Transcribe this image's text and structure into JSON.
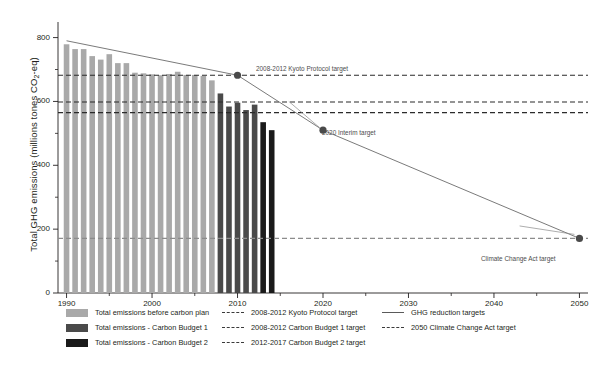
{
  "chart_data": {
    "type": "bar",
    "title": "",
    "xlabel": "",
    "ylabel": "Total GHG emissions (millions tones CO2-eq)",
    "ylabel_parts": {
      "pre": "Total GHG emissions (millions tones CO",
      "sub": "2",
      "post": "-eq)"
    },
    "xlim": [
      1989,
      2051
    ],
    "ylim": [
      0,
      830
    ],
    "yticks": [
      0,
      200,
      400,
      600,
      800
    ],
    "yticklabels": [
      "0",
      "200",
      "400",
      "600",
      "800"
    ],
    "yticks_minor": [
      100,
      300,
      500,
      700
    ],
    "xticks": [
      1990,
      2000,
      2010,
      2020,
      2030,
      2040,
      2050
    ],
    "xticklabels": [
      "1990",
      "2000",
      "2010",
      "2020",
      "2030",
      "2040",
      "2050"
    ],
    "grid": false,
    "legend_position": "below",
    "categories": [
      1990,
      1991,
      1992,
      1993,
      1994,
      1995,
      1996,
      1997,
      1998,
      1999,
      2000,
      2001,
      2002,
      2003,
      2004,
      2005,
      2006,
      2007,
      2008,
      2009,
      2010,
      2011,
      2012,
      2013,
      2014
    ],
    "series": [
      {
        "name": "Total emissions before carbon plan",
        "color": "#a9a9a9",
        "x": [
          1990,
          1991,
          1992,
          1993,
          1994,
          1995,
          1996,
          1997,
          1998,
          1999,
          2000,
          2001,
          2002,
          2003,
          2004,
          2005,
          2006,
          2007
        ],
        "values": [
          779,
          764,
          764,
          742,
          731,
          748,
          720,
          720,
          690,
          688,
          685,
          682,
          686,
          693,
          683,
          683,
          680,
          666
        ]
      },
      {
        "name": "Total emissions - Carbon Budget 1",
        "color": "#4a4a4a",
        "x": [
          2008,
          2009,
          2010,
          2011,
          2012
        ],
        "values": [
          625,
          584,
          596,
          573,
          590
        ]
      },
      {
        "name": "Total emissions - Carbon Budget 2",
        "color": "#1a1a1a",
        "x": [
          2013,
          2014
        ],
        "values": [
          535,
          510
        ]
      }
    ],
    "hlines": [
      {
        "name": "2008-2012 Kyoto Protocol target",
        "value": 682,
        "color": "#2b2b2b",
        "style": "dashed"
      },
      {
        "name": "2008-2012 Carbon Budget 1 target",
        "value": 598,
        "color": "#2b2b2b",
        "style": "dashed"
      },
      {
        "name": "2012-2017 Carbon Budget 2 target",
        "value": 565,
        "color": "#2b2b2b",
        "style": "dashed"
      },
      {
        "name": "2050 Climate Change Act target",
        "value": 171,
        "color": "#8c8c8c",
        "style": "dashed"
      }
    ],
    "target_line": {
      "name": "GHG reduction targets",
      "color": "#6b6b6b",
      "points": [
        {
          "x": 1990,
          "y": 790
        },
        {
          "x": 2010,
          "y": 682
        },
        {
          "x": 2020,
          "y": 510
        },
        {
          "x": 2050,
          "y": 171
        }
      ]
    },
    "markers": [
      {
        "label": "2008-2012 Kyoto Protocol target",
        "x": 2010,
        "y": 682
      },
      {
        "label": "2020 Interim target",
        "x": 2020,
        "y": 510
      },
      {
        "label": "Climate Change Act target",
        "x": 2050,
        "y": 171
      }
    ],
    "annotations": [
      {
        "text": "2008-2012 Kyoto Protocol target",
        "x_px": 256,
        "y_px": 65
      },
      {
        "text": "2020 Interim target",
        "x_px": 322,
        "y_px": 129
      },
      {
        "text": "Climate Change Act target",
        "x_px": 481,
        "y_px": 255
      }
    ]
  },
  "legend": {
    "columns": [
      {
        "entries": [
          {
            "kind": "swatch",
            "color": "#a9a9a9",
            "label": "Total emissions before carbon plan"
          },
          {
            "kind": "swatch",
            "color": "#4a4a4a",
            "label": "Total emissions - Carbon Budget 1"
          },
          {
            "kind": "swatch",
            "color": "#1a1a1a",
            "label": "Total emissions - Carbon Budget 2"
          }
        ]
      },
      {
        "entries": [
          {
            "kind": "dashed",
            "color": "#3a3a3a",
            "label": "2008-2012 Kyoto Protocol target"
          },
          {
            "kind": "dashed",
            "color": "#3a3a3a",
            "label": "2008-2012 Carbon Budget 1 target"
          },
          {
            "kind": "dashed",
            "color": "#3a3a3a",
            "label": "2012-2017 Carbon Budget 2 target"
          }
        ]
      },
      {
        "entries": [
          {
            "kind": "solid",
            "color": "#5a5a5a",
            "label": "GHG reduction targets"
          },
          {
            "kind": "dashed",
            "color": "#3a3a3a",
            "label": "2050 Climate Change Act target"
          }
        ]
      }
    ]
  }
}
